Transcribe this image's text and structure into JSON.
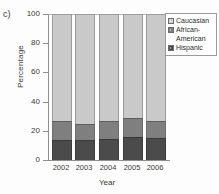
{
  "panel": {
    "label": "c)"
  },
  "chart_data": {
    "type": "bar",
    "subtype": "stacked-bar-100",
    "title": "",
    "xlabel": "Year",
    "ylabel": "Percentage",
    "categories": [
      "2002",
      "2003",
      "2004",
      "2005",
      "2006"
    ],
    "ylim": [
      0,
      100
    ],
    "yticks": [
      0,
      20,
      40,
      60,
      80,
      100
    ],
    "ytick_labels": [
      "0",
      "20",
      "40",
      "60",
      "80",
      "100"
    ],
    "grid": false,
    "legend_position": "top-right",
    "series": [
      {
        "name": "Caucasian",
        "color": "#c9c9c9",
        "values": [
          73.5,
          75.0,
          73.5,
          71.5,
          73.0
        ]
      },
      {
        "name": "African-American",
        "color": "#7f7f7f",
        "values": [
          13.0,
          11.0,
          12.0,
          13.0,
          12.0
        ]
      },
      {
        "name": "Hispanic",
        "color": "#4b4b4b",
        "values": [
          13.5,
          14.0,
          14.5,
          15.5,
          15.0
        ]
      }
    ]
  },
  "legend": {
    "entries": [
      {
        "label": "Caucasian",
        "color": "#c9c9c9"
      },
      {
        "label": "African-\nAmerican",
        "color": "#7f7f7f"
      },
      {
        "label": "Hispanic",
        "color": "#4b4b4b"
      }
    ]
  }
}
